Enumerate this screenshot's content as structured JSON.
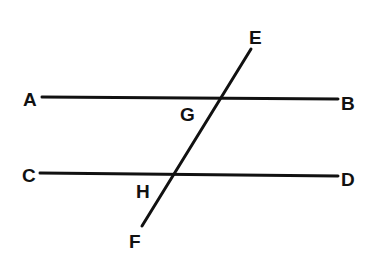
{
  "diagram": {
    "lines": [
      {
        "name": "AB",
        "from": "A",
        "to": "B"
      },
      {
        "name": "CD",
        "from": "C",
        "to": "D"
      },
      {
        "name": "EF",
        "from": "E",
        "to": "F"
      }
    ],
    "labels": {
      "A": "A",
      "B": "B",
      "C": "C",
      "D": "D",
      "E": "E",
      "F": "F",
      "G": "G",
      "H": "H"
    },
    "intersections": [
      {
        "point": "G",
        "lines": [
          "AB",
          "EF"
        ]
      },
      {
        "point": "H",
        "lines": [
          "CD",
          "EF"
        ]
      }
    ],
    "stroke_color": "#111111",
    "background": "#ffffff"
  }
}
